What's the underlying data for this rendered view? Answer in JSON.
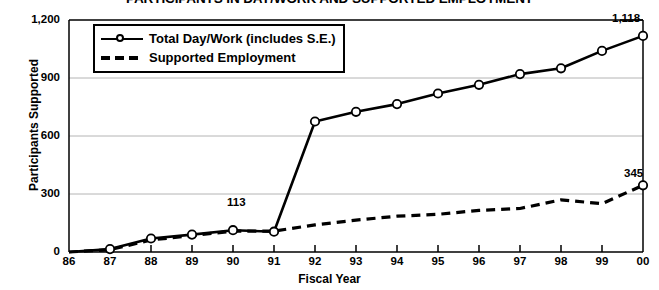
{
  "chart_data": {
    "type": "line",
    "title": "PARTICIPANTS IN DAY/WORK AND SUPPORTED EMPLOYMENT",
    "xlabel": "Fiscal Year",
    "ylabel": "Participants Supported",
    "categories": [
      "86",
      "87",
      "88",
      "89",
      "90",
      "91",
      "92",
      "93",
      "94",
      "95",
      "96",
      "97",
      "98",
      "99",
      "00"
    ],
    "ylim": [
      0,
      1200
    ],
    "yticks": [
      0,
      300,
      600,
      900,
      1200
    ],
    "ytick_labels": [
      "0",
      "300",
      "600",
      "900",
      "1,200"
    ],
    "grid": "horizontal",
    "legend_position": "top-left-inside",
    "series": [
      {
        "name": "Total Day/Work (includes S.E.)",
        "style": "solid",
        "marker": "open-circle",
        "values": [
          0,
          15,
          70,
          90,
          113,
          105,
          675,
          725,
          765,
          820,
          865,
          920,
          950,
          1040,
          1118
        ]
      },
      {
        "name": "Supported Employment",
        "style": "dashed",
        "marker": "open-circle-last-only",
        "values": [
          0,
          12,
          62,
          85,
          108,
          108,
          140,
          165,
          185,
          195,
          215,
          225,
          270,
          250,
          345
        ]
      }
    ],
    "annotations": [
      {
        "text": "113",
        "series": "Total Day/Work (includes S.E.)",
        "x": "90",
        "value": 113
      },
      {
        "text": "1,118",
        "series": "Total Day/Work (includes S.E.)",
        "x": "00",
        "value": 1118
      },
      {
        "text": "345",
        "series": "Supported Employment",
        "x": "00",
        "value": 345
      }
    ]
  },
  "legend": {
    "items": [
      {
        "label": "Total Day/Work (includes S.E.)"
      },
      {
        "label": "Supported Employment"
      }
    ]
  },
  "colors": {
    "line": "#000000",
    "grid": "#b4b4b4",
    "axis": "#000000",
    "background": "#ffffff"
  }
}
